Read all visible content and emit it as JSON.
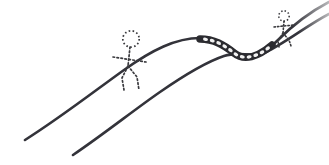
{
  "image": {
    "kind": "hand-drawn-sketch",
    "width": 329,
    "height": 165,
    "background_color": "#ffffff",
    "ink_color": "#3a3a3e",
    "ink_color_dark": "#2b2b30",
    "caption": ""
  },
  "scene": {
    "description": "Two hand-drawn rising curves crossing the frame from lower-left to upper-right, with a textured beaded dip where they converge, and two dotted stick figures walking along the upper curve.",
    "elements": [
      "upper-slope-curve",
      "lower-slope-curve",
      "beaded-dip-band",
      "left-stick-figure",
      "right-stick-figure"
    ]
  },
  "curves": {
    "upper": {
      "name": "upper-slope-curve",
      "path": "M25,140 C60,118 96,90 124,70 C152,50 176,38 200,38 C216,38 226,44 236,52 C248,62 262,56 278,40 C292,26 310,12 329,2",
      "stroke_width": 2.6,
      "color": "#33333a",
      "start_point": [
        25,
        140
      ],
      "end_point": [
        329,
        2
      ]
    },
    "lower": {
      "name": "lower-slope-curve",
      "path": "M73,155 C104,134 134,110 160,92 C186,74 206,62 224,56 C240,51 252,58 266,52 C284,44 306,26 329,14",
      "stroke_width": 2.6,
      "color": "#33333a",
      "start_point": [
        73,
        155
      ],
      "end_point": [
        329,
        14
      ]
    }
  },
  "beaded_band": {
    "name": "beaded-dip-band",
    "description": "Thick dark band with small light oval beads along the dip of the upper curve",
    "path": "M200,39 C214,39 224,45 234,53 C244,61 258,57 272,45",
    "band_width": 7.5,
    "band_color": "#2b2b30",
    "bead_color": "#f2f2f2",
    "bead_count": 11
  },
  "figures": [
    {
      "name": "left-stick-figure",
      "style": "dotted",
      "color": "#3a3a3e",
      "head": {
        "cx": 131,
        "cy": 39,
        "r": 8.2
      },
      "spine": "M130,47 L128,66",
      "arms": "M113,57 L146,62",
      "legs": "M128,66 L122,78 L124,90 M128,66 L137,77 L139,90",
      "dash": "1.6 2.4",
      "stroke_width": 1.7
    },
    {
      "name": "right-stick-figure",
      "style": "dotted",
      "color": "#3a3a3e",
      "head": {
        "cx": 284,
        "cy": 16,
        "r": 5.2
      },
      "spine": "M284,21 L283,33",
      "arms": "M274,27 L294,25",
      "legs": "M283,33 L278,41 L279,47 M283,33 L289,40 L291,46",
      "dash": "1.4 2.1",
      "stroke_width": 1.6
    }
  ]
}
